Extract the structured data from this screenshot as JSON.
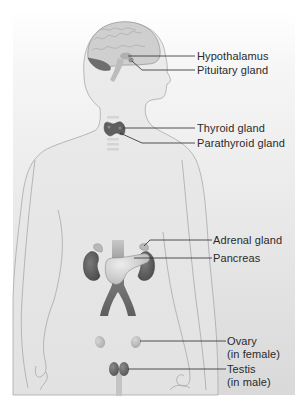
{
  "figure": {
    "colors": {
      "background_top": "#f7f7f7",
      "background_bottom": "#dcdcdc",
      "body_fill": "#e6e6e6",
      "body_outline": "#a8a8a8",
      "brain_fill": "#cfcfcf",
      "brain_outline": "#9a9a9a",
      "cerebellum_fill": "#6e6e6e",
      "gland_dark": "#5a5a5a",
      "gland_light": "#bdbdbd",
      "leader_line": "#2a2a2a",
      "label_text": "#2a2a2a"
    }
  },
  "labels": [
    {
      "id": "hypothalamus",
      "text": "Hypothalamus"
    },
    {
      "id": "pituitary",
      "text": "Pituitary gland"
    },
    {
      "id": "thyroid",
      "text": "Thyroid gland"
    },
    {
      "id": "parathyroid",
      "text": "Parathyroid gland"
    },
    {
      "id": "adrenal",
      "text": "Adrenal gland"
    },
    {
      "id": "pancreas",
      "text": "Pancreas"
    },
    {
      "id": "ovary",
      "text": "Ovary",
      "text2": "(in female)"
    },
    {
      "id": "testis",
      "text": "Testis",
      "text2": "(in male)"
    }
  ]
}
